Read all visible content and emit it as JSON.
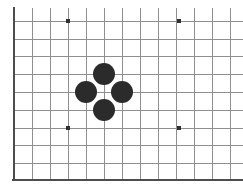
{
  "figure": {
    "kind": "go-board-diagram",
    "width": 243,
    "height": 195,
    "background_color": "#ffffff",
    "cropped_right_edge": true,
    "cropped_top_edge": true
  },
  "board": {
    "grid_spacing": 18,
    "origin_x": 14,
    "origin_y": 21,
    "vertical_line_x": [
      14,
      32,
      50,
      68,
      86,
      104,
      122,
      140,
      158,
      176,
      194,
      212,
      230
    ],
    "horizontal_line_y": [
      21,
      39,
      56,
      74,
      92,
      110,
      128,
      145,
      163,
      180
    ],
    "grid_line_color": "#8f8f8f",
    "grid_line_width": 1,
    "border_color": "#4d4d4d",
    "border_width": 2.6,
    "border_edges": [
      "left",
      "bottom"
    ],
    "left_border_x": 14,
    "bottom_border_y": 180,
    "board_top_y": 8,
    "board_right_x": 243
  },
  "star_points": {
    "label": "hoshi",
    "color": "#303030",
    "radius": 2.2,
    "points": [
      {
        "name": "star-point-top-left",
        "x": 68,
        "y": 21
      },
      {
        "name": "star-point-top-right",
        "x": 179,
        "y": 21
      },
      {
        "name": "star-point-bottom-left",
        "x": 68,
        "y": 128
      },
      {
        "name": "star-point-bottom-right",
        "x": 179,
        "y": 128
      }
    ]
  },
  "stones": {
    "count": 4,
    "formation": "diamond",
    "black_color": "#2b2b2b",
    "radius": 11,
    "empty_center": {
      "x": 104,
      "y": 92
    },
    "items": [
      {
        "name": "black-stone-top",
        "color": "black",
        "x": 104,
        "y": 74
      },
      {
        "name": "black-stone-left",
        "color": "black",
        "x": 86,
        "y": 92
      },
      {
        "name": "black-stone-right",
        "color": "black",
        "x": 122,
        "y": 92
      },
      {
        "name": "black-stone-bottom",
        "color": "black",
        "x": 104,
        "y": 110
      }
    ]
  }
}
